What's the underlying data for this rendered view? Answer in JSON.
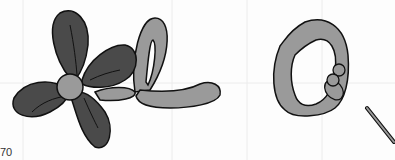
{
  "figure": {
    "caption_fragment": "70",
    "colors": {
      "dark_petal": "#4a4a4a",
      "light_balloon": "#9a9a9a",
      "outline": "#111111",
      "grid": "#ececec"
    },
    "items": [
      {
        "name": "balloon-flower",
        "description": "four dark balloon petals with light center and light loop stem"
      },
      {
        "name": "balloon-heart",
        "description": "light balloon heart with small bubbles and thin stick"
      }
    ]
  }
}
